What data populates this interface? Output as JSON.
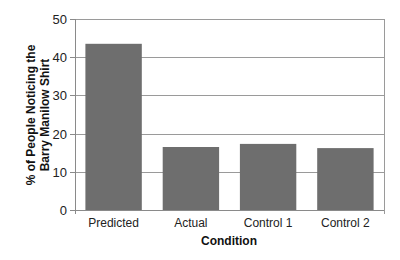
{
  "chart_data": {
    "type": "bar",
    "title": "",
    "categories": [
      "Predicted",
      "Actual",
      "Control 1",
      "Control 2"
    ],
    "values": [
      43.5,
      16.5,
      17.3,
      16.2
    ],
    "xlabel": "Condition",
    "ylabel_lines": [
      "% of People Noticing the",
      "Barry Manilow Shirt"
    ],
    "ylabel": "% of People Noticing the Barry Manilow Shirt",
    "ylim": [
      0,
      50
    ],
    "yticks": [
      0,
      10,
      20,
      30,
      40,
      50
    ],
    "grid": true,
    "legend": null,
    "bar_color": "#6e6e6e",
    "grid_color": "#9a9a9a",
    "axis_color": "#8a8a8a"
  }
}
